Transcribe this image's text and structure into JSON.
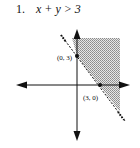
{
  "problem": {
    "number": "1.",
    "inequality": "x + y > 3"
  },
  "graph": {
    "boundary": "dashed",
    "shading": "above-right of line",
    "points": [
      {
        "label": "(0, 3)",
        "x": 0,
        "y": 3
      },
      {
        "label": "(3, 0)",
        "x": 3,
        "y": 0
      }
    ],
    "colors": {
      "axis": "#111111",
      "shade": "#b8b8b8"
    }
  }
}
